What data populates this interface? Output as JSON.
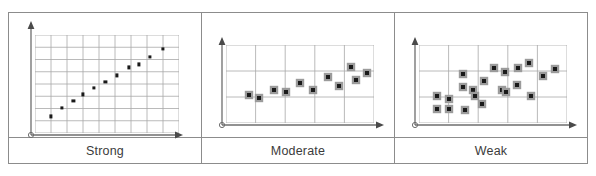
{
  "figure": {
    "title": "",
    "panel_labels": [
      "Strong",
      "Moderate",
      "Weak"
    ],
    "colors": {
      "frame_border": "#8c8c8c",
      "grid_line": "#a8a8a8",
      "axis_line": "#6e6e6e",
      "point_fill": "#1a1a1a",
      "point_halo": "#9b9b9b",
      "label_text": "#3b3b3b",
      "background": "#ffffff"
    }
  },
  "chart_data": [
    {
      "type": "scatter",
      "title": "Strong",
      "xlabel": "",
      "ylabel": "",
      "xlim": [
        0,
        9
      ],
      "ylim": [
        0,
        8
      ],
      "grid": true,
      "grid_cols": 9,
      "grid_rows": 8,
      "marker": "small-square",
      "legend": "none",
      "points": [
        {
          "x": 1.0,
          "y": 1.35
        },
        {
          "x": 1.7,
          "y": 2.05
        },
        {
          "x": 2.4,
          "y": 2.65
        },
        {
          "x": 3.0,
          "y": 3.15
        },
        {
          "x": 3.7,
          "y": 3.65
        },
        {
          "x": 4.4,
          "y": 4.2
        },
        {
          "x": 5.1,
          "y": 4.7
        },
        {
          "x": 5.85,
          "y": 5.35
        },
        {
          "x": 6.5,
          "y": 5.6
        },
        {
          "x": 7.2,
          "y": 6.2
        },
        {
          "x": 8.0,
          "y": 6.85
        }
      ]
    },
    {
      "type": "scatter",
      "title": "Moderate",
      "xlabel": "",
      "ylabel": "",
      "xlim": [
        0,
        5
      ],
      "ylim": [
        0,
        3
      ],
      "grid": true,
      "grid_cols": 5,
      "grid_rows": 3,
      "marker": "haloed-square",
      "legend": "none",
      "points": [
        {
          "x": 0.78,
          "y": 1.08
        },
        {
          "x": 1.12,
          "y": 0.98
        },
        {
          "x": 1.62,
          "y": 1.28
        },
        {
          "x": 2.02,
          "y": 1.18
        },
        {
          "x": 2.5,
          "y": 1.55
        },
        {
          "x": 2.95,
          "y": 1.26
        },
        {
          "x": 3.45,
          "y": 1.78
        },
        {
          "x": 3.82,
          "y": 1.42
        },
        {
          "x": 4.22,
          "y": 2.14
        },
        {
          "x": 4.4,
          "y": 1.65
        },
        {
          "x": 4.78,
          "y": 1.92
        }
      ]
    },
    {
      "type": "scatter",
      "title": "Weak",
      "xlabel": "",
      "ylabel": "",
      "xlim": [
        0,
        5
      ],
      "ylim": [
        0,
        3
      ],
      "grid": true,
      "grid_cols": 5,
      "grid_rows": 3,
      "marker": "haloed-square",
      "legend": "none",
      "points": [
        {
          "x": 0.62,
          "y": 0.52
        },
        {
          "x": 0.62,
          "y": 1.02
        },
        {
          "x": 1.02,
          "y": 0.52
        },
        {
          "x": 1.02,
          "y": 0.92
        },
        {
          "x": 1.48,
          "y": 1.88
        },
        {
          "x": 1.5,
          "y": 1.4
        },
        {
          "x": 1.55,
          "y": 0.5
        },
        {
          "x": 1.82,
          "y": 1.28
        },
        {
          "x": 1.9,
          "y": 1.02
        },
        {
          "x": 2.12,
          "y": 0.72
        },
        {
          "x": 2.2,
          "y": 1.62
        },
        {
          "x": 2.55,
          "y": 2.12
        },
        {
          "x": 2.82,
          "y": 1.28
        },
        {
          "x": 2.9,
          "y": 1.98
        },
        {
          "x": 2.95,
          "y": 1.18
        },
        {
          "x": 3.3,
          "y": 1.45
        },
        {
          "x": 3.35,
          "y": 2.12
        },
        {
          "x": 3.72,
          "y": 2.32
        },
        {
          "x": 3.78,
          "y": 1.02
        },
        {
          "x": 4.2,
          "y": 1.82
        },
        {
          "x": 4.6,
          "y": 2.08
        }
      ]
    }
  ]
}
